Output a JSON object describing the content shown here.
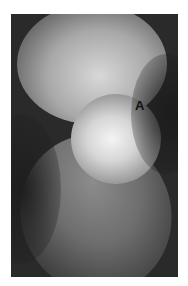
{
  "figure": {
    "type": "radiograph",
    "annotations": [
      {
        "label": "A"
      }
    ]
  }
}
